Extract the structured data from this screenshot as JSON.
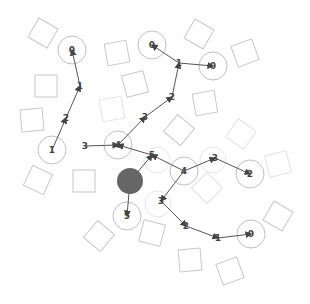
{
  "diagram": {
    "type": "path-planning-graph",
    "agent": {
      "x": 130,
      "y": 181,
      "r": 13,
      "color": "#666666"
    },
    "obstacles": [
      {
        "x": 43,
        "y": 33,
        "size": 22,
        "rot": 30
      },
      {
        "x": 117,
        "y": 53,
        "size": 22,
        "rot": -10
      },
      {
        "x": 199,
        "y": 34,
        "size": 22,
        "rot": 30
      },
      {
        "x": 245,
        "y": 53,
        "size": 22,
        "rot": -20
      },
      {
        "x": 46,
        "y": 86,
        "size": 22,
        "rot": 0
      },
      {
        "x": 135,
        "y": 84,
        "size": 22,
        "rot": -15
      },
      {
        "x": 112,
        "y": 109,
        "size": 22,
        "rot": -10,
        "faint": true
      },
      {
        "x": 32,
        "y": 120,
        "size": 22,
        "rot": -5
      },
      {
        "x": 205,
        "y": 103,
        "size": 22,
        "rot": -10
      },
      {
        "x": 179,
        "y": 130,
        "size": 22,
        "rot": 40
      },
      {
        "x": 241,
        "y": 134,
        "size": 22,
        "rot": 35,
        "faint": true
      },
      {
        "x": 278,
        "y": 164,
        "size": 22,
        "rot": -15,
        "faint": true
      },
      {
        "x": 38,
        "y": 180,
        "size": 22,
        "rot": 25
      },
      {
        "x": 84,
        "y": 181,
        "size": 22,
        "rot": 0
      },
      {
        "x": 207,
        "y": 188,
        "size": 22,
        "rot": 45,
        "faint": true
      },
      {
        "x": 99,
        "y": 236,
        "size": 22,
        "rot": 40
      },
      {
        "x": 152,
        "y": 233,
        "size": 22,
        "rot": 15
      },
      {
        "x": 278,
        "y": 216,
        "size": 22,
        "rot": 30
      },
      {
        "x": 190,
        "y": 260,
        "size": 22,
        "rot": -5
      },
      {
        "x": 230,
        "y": 271,
        "size": 22,
        "rot": -20
      }
    ],
    "waypoints": [
      {
        "x": 72,
        "y": 50,
        "r": 14
      },
      {
        "x": 152,
        "y": 45,
        "r": 14
      },
      {
        "x": 213,
        "y": 66,
        "r": 14
      },
      {
        "x": 52,
        "y": 150,
        "r": 14
      },
      {
        "x": 118,
        "y": 145,
        "r": 14
      },
      {
        "x": 184,
        "y": 171,
        "r": 14
      },
      {
        "x": 250,
        "y": 174,
        "r": 14
      },
      {
        "x": 127,
        "y": 216,
        "r": 14
      },
      {
        "x": 251,
        "y": 234,
        "r": 14
      },
      {
        "x": 157,
        "y": 160,
        "r": 13,
        "faint": true
      },
      {
        "x": 213,
        "y": 160,
        "r": 13,
        "faint": true
      },
      {
        "x": 158,
        "y": 204,
        "r": 13,
        "faint": true
      }
    ],
    "paths": [
      {
        "points": [
          [
            52,
            150
          ],
          [
            66,
            118
          ],
          [
            80,
            86
          ],
          [
            72,
            50
          ]
        ],
        "labels": [
          "",
          "2",
          "1",
          "0"
        ]
      },
      {
        "points": [
          [
            118,
            145
          ],
          [
            145,
            117
          ],
          [
            172,
            97
          ],
          [
            179,
            63
          ],
          [
            213,
            66
          ]
        ],
        "labels": [
          "",
          "3",
          "2",
          "1",
          "0"
        ]
      },
      {
        "points": [
          [
            179,
            63
          ],
          [
            152,
            45
          ]
        ],
        "labels": [
          "",
          "0"
        ]
      },
      {
        "points": [
          [
            85,
            146
          ],
          [
            118,
            145
          ]
        ],
        "labels": [
          "3",
          ""
        ]
      },
      {
        "points": [
          [
            184,
            171
          ],
          [
            152,
            155
          ],
          [
            118,
            145
          ]
        ],
        "labels": [
          "",
          "5",
          ""
        ]
      },
      {
        "points": [
          [
            184,
            171
          ],
          [
            215,
            158
          ],
          [
            250,
            174
          ]
        ],
        "labels": [
          "",
          "3",
          "2"
        ]
      },
      {
        "points": [
          [
            184,
            171
          ],
          [
            161,
            201
          ],
          [
            186,
            226
          ],
          [
            218,
            238
          ],
          [
            251,
            234
          ]
        ],
        "labels": [
          "",
          "3",
          "2",
          "1",
          "0"
        ]
      },
      {
        "points": [
          [
            130,
            181
          ],
          [
            152,
            155
          ]
        ],
        "labels": [
          "",
          ""
        ]
      },
      {
        "points": [
          [
            130,
            181
          ],
          [
            127,
            216
          ]
        ],
        "labels": [
          "",
          "5"
        ]
      }
    ],
    "labels": [
      {
        "text": "0",
        "x": 72,
        "y": 50
      },
      {
        "text": "1",
        "x": 80,
        "y": 86
      },
      {
        "text": "2",
        "x": 66,
        "y": 118
      },
      {
        "text": "1",
        "x": 52,
        "y": 150
      },
      {
        "text": "3",
        "x": 85,
        "y": 146
      },
      {
        "text": "0",
        "x": 152,
        "y": 45
      },
      {
        "text": "1",
        "x": 179,
        "y": 63
      },
      {
        "text": "0",
        "x": 213,
        "y": 66
      },
      {
        "text": "2",
        "x": 172,
        "y": 97
      },
      {
        "text": "3",
        "x": 145,
        "y": 117
      },
      {
        "text": "4",
        "x": 118,
        "y": 145
      },
      {
        "text": "5",
        "x": 152,
        "y": 155
      },
      {
        "text": "4",
        "x": 184,
        "y": 171
      },
      {
        "text": "3",
        "x": 215,
        "y": 158
      },
      {
        "text": "2",
        "x": 250,
        "y": 174
      },
      {
        "text": "5",
        "x": 127,
        "y": 216
      },
      {
        "text": "3",
        "x": 161,
        "y": 201
      },
      {
        "text": "2",
        "x": 186,
        "y": 226
      },
      {
        "text": "1",
        "x": 218,
        "y": 238
      },
      {
        "text": "0",
        "x": 251,
        "y": 234
      }
    ],
    "colors": {
      "obstacle_stroke": "#c8c8c8",
      "obstacle_faint": "#e2e2e2",
      "waypoint_stroke": "#c0c0c0",
      "waypoint_faint": "#e6e6e6",
      "path_stroke": "#555555",
      "marker_fill": "#444444",
      "agent_fill": "#666666"
    }
  }
}
